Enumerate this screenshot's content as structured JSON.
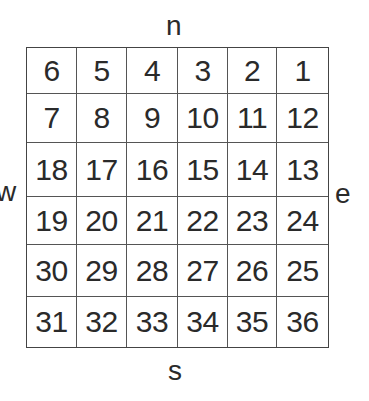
{
  "directions": {
    "north": "n",
    "south": "s",
    "west": "w",
    "east": "e"
  },
  "grid": {
    "rows": [
      [
        "6",
        "5",
        "4",
        "3",
        "2",
        "1"
      ],
      [
        "7",
        "8",
        "9",
        "10",
        "11",
        "12"
      ],
      [
        "18",
        "17",
        "16",
        "15",
        "14",
        "13"
      ],
      [
        "19",
        "20",
        "21",
        "22",
        "23",
        "24"
      ],
      [
        "30",
        "29",
        "28",
        "27",
        "26",
        "25"
      ],
      [
        "31",
        "32",
        "33",
        "34",
        "35",
        "36"
      ]
    ]
  }
}
